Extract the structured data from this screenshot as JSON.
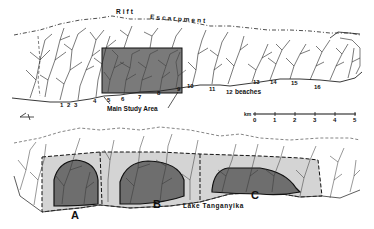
{
  "top_map": {
    "escarpment_label_1": "Rift",
    "escarpment_label_2": "Escarpment",
    "study_area_label": "Main Study Area",
    "beaches_label": "beaches",
    "stream_numbers": [
      "1",
      "2",
      "3",
      "4",
      "5",
      "6",
      "7",
      "8",
      "9",
      "10",
      "11",
      "12",
      "13",
      "14",
      "15",
      "16"
    ],
    "shaded_color": "#7a7a7a"
  },
  "scale_bar": {
    "unit": "km",
    "ticks": [
      "0",
      "1",
      "2",
      "3",
      "4",
      "5"
    ]
  },
  "bottom_map": {
    "lake_label": "Lake Tanganyika",
    "zones": [
      {
        "label": "A"
      },
      {
        "label": "B"
      },
      {
        "label": "C"
      }
    ],
    "dark_zone_color": "#6e6e6e",
    "light_zone_color": "#d4d4d4"
  },
  "north_arrow": {
    "symbol": "north-arrow"
  }
}
